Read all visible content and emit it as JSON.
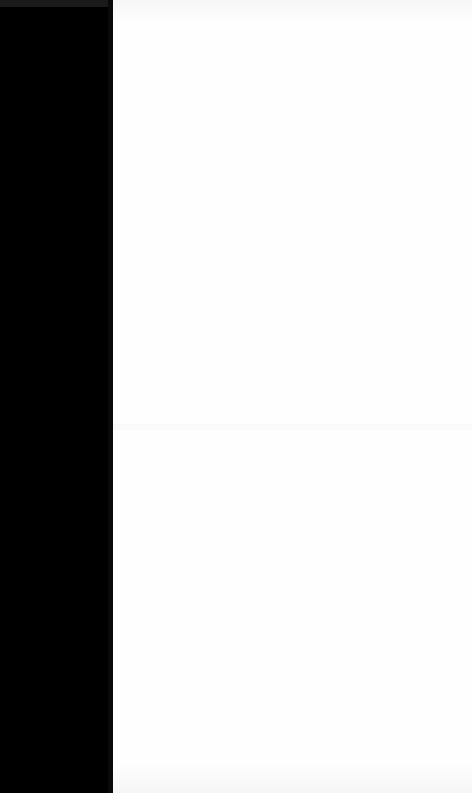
{
  "screen": {
    "width": 472,
    "height": 793
  },
  "left_panel": {
    "color": "#000000",
    "width": 113
  },
  "content_area": {
    "color": "#fefefe",
    "text": ""
  }
}
